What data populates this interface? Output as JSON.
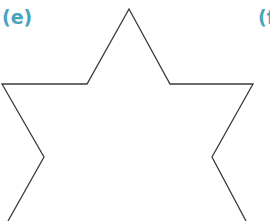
{
  "labels": {
    "left": "(e)",
    "right": "(f"
  },
  "colors": {
    "label": "#4aa3bd",
    "stroke": "#3a3a3a",
    "background": "#ffffff"
  },
  "shape": {
    "type": "six-pointed star outline (partial, cropped at bottom)",
    "points": "129,9 170,84 253,84 212,157 246,221 8,221 44,157 2,84 87,84"
  }
}
